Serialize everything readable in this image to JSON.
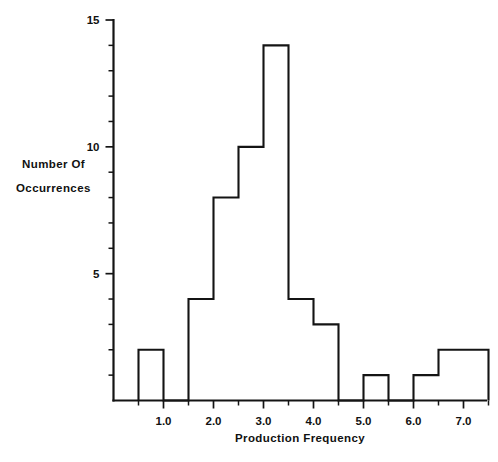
{
  "chart_data": {
    "type": "bar",
    "title": "",
    "xlabel": "Production Frequency",
    "ylabel": "Number Of Occurrences",
    "ylabel_lines": [
      "Number Of",
      "Occurrences"
    ],
    "bin_width": 0.5,
    "bin_starts": [
      0.5,
      1.0,
      1.5,
      2.0,
      2.5,
      3.0,
      3.5,
      4.0,
      4.5,
      5.0,
      5.5,
      6.0,
      6.5,
      7.0
    ],
    "bin_ends": [
      1.0,
      1.5,
      2.0,
      2.5,
      3.0,
      3.5,
      4.0,
      4.5,
      5.0,
      5.5,
      6.0,
      6.5,
      7.0,
      7.5
    ],
    "categories": [
      "0.5-1.0",
      "1.0-1.5",
      "1.5-2.0",
      "2.0-2.5",
      "2.5-3.0",
      "3.0-3.5",
      "3.5-4.0",
      "4.0-4.5",
      "4.5-5.0",
      "5.0-5.5",
      "5.5-6.0",
      "6.0-6.5",
      "6.5-7.0",
      "7.0-7.5"
    ],
    "values": [
      2,
      0,
      4,
      8,
      10,
      14,
      4,
      3,
      0,
      1,
      0,
      1,
      2,
      2
    ],
    "xlim": [
      0.5,
      7.5
    ],
    "ylim": [
      0,
      15
    ],
    "xticks": [
      1.0,
      2.0,
      3.0,
      4.0,
      5.0,
      6.0,
      7.0
    ],
    "xtick_labels": [
      "1.0",
      "2.0",
      "3.0",
      "4.0",
      "5.0",
      "6.0",
      "7.0"
    ],
    "yticks": [
      0,
      1,
      2,
      3,
      4,
      5,
      6,
      7,
      8,
      9,
      10,
      11,
      12,
      13,
      14,
      15
    ],
    "ytick_labels_major": {
      "5": "5",
      "10": "10",
      "15": "15"
    },
    "ytick_major_values": [
      5,
      10,
      15
    ],
    "grid": false,
    "legend": false,
    "line_color": "#141414",
    "fill_color": "#ffffff",
    "background_color": "#ffffff"
  }
}
